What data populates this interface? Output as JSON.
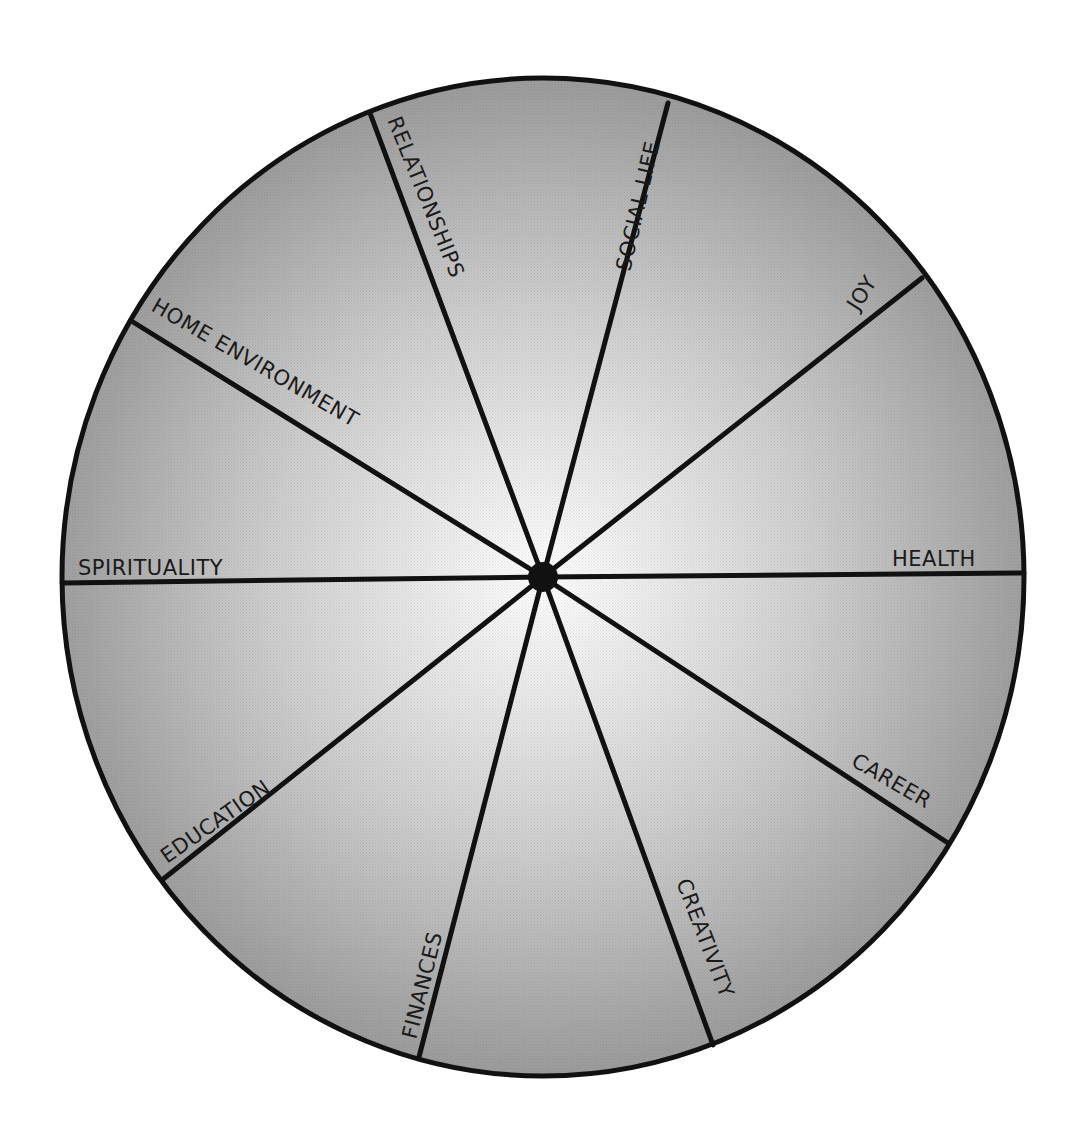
{
  "diagram": {
    "type": "wheel-of-life",
    "center": {
      "x": 543,
      "y": 577
    },
    "radius": {
      "rx": 481,
      "ry": 499
    },
    "colors": {
      "fill_center": "#ffffff",
      "fill_edge": "#9c9c9c",
      "stroke": "#111111",
      "hub": "#111111",
      "background": "#ffffff"
    },
    "segments": [
      {
        "label": "RELATIONSHIPS",
        "spoke_end": {
          "x": 370,
          "y": 113
        }
      },
      {
        "label": "SOCIAL LIFE",
        "spoke_end": {
          "x": 668,
          "y": 103
        }
      },
      {
        "label": "JOY",
        "spoke_end": {
          "x": 922,
          "y": 278
        }
      },
      {
        "label": "HEALTH",
        "spoke_end": {
          "x": 1024,
          "y": 573
        }
      },
      {
        "label": "CAREER",
        "spoke_end": {
          "x": 948,
          "y": 843
        }
      },
      {
        "label": "CREATIVITY",
        "spoke_end": {
          "x": 713,
          "y": 1045
        }
      },
      {
        "label": "FINANCES",
        "spoke_end": {
          "x": 419,
          "y": 1057
        }
      },
      {
        "label": "EDUCATION",
        "spoke_end": {
          "x": 162,
          "y": 880
        }
      },
      {
        "label": "SPIRITUALITY",
        "spoke_end": {
          "x": 62,
          "y": 583
        }
      },
      {
        "label": "HOME ENVIRONMENT",
        "spoke_end": {
          "x": 133,
          "y": 322
        }
      }
    ]
  }
}
